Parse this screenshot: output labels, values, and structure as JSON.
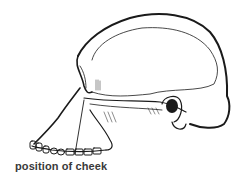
{
  "diagram": {
    "label": "position of cheek",
    "colors": {
      "line": "#1a1a1a",
      "background": "#ffffff",
      "label": "#3a3a3a"
    }
  }
}
